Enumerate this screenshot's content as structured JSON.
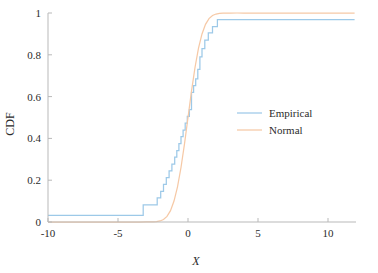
{
  "chart_data": {
    "type": "line",
    "title": "",
    "xlabel": "X",
    "ylabel": "CDF",
    "xlim": [
      -10,
      12
    ],
    "ylim": [
      0,
      1
    ],
    "xticks": [
      -10,
      -5,
      0,
      5,
      10
    ],
    "xticklabels": [
      "-10",
      "-5",
      "0",
      "5",
      "10"
    ],
    "yticks": [
      0,
      0.2,
      0.4,
      0.6,
      0.8,
      1
    ],
    "yticklabels": [
      "0",
      "0.2",
      "0.4",
      "0.6",
      "0.8",
      "1"
    ],
    "grid": false,
    "legend_position": "center-right",
    "series": [
      {
        "name": "Empirical",
        "color": "#9dc9e8",
        "style": "step-post",
        "x": [
          -10,
          -5.4,
          -3.2,
          -2.6,
          -2.2,
          -1.95,
          -1.75,
          -1.55,
          -1.35,
          -1.15,
          -0.95,
          -0.8,
          -0.65,
          -0.5,
          -0.35,
          -0.2,
          -0.05,
          0.1,
          0.25,
          0.4,
          0.55,
          0.7,
          0.85,
          1.0,
          1.2,
          1.45,
          1.75,
          2.1,
          11.9
        ],
        "y": [
          0.032,
          0.032,
          0.082,
          0.082,
          0.115,
          0.147,
          0.18,
          0.212,
          0.245,
          0.277,
          0.31,
          0.342,
          0.375,
          0.408,
          0.44,
          0.473,
          0.505,
          0.538,
          0.62,
          0.652,
          0.685,
          0.73,
          0.79,
          0.83,
          0.87,
          0.905,
          0.935,
          0.968,
          0.968
        ]
      },
      {
        "name": "Normal",
        "color": "#f6c9a6",
        "style": "smooth",
        "mu": 0.0,
        "sigma": 0.78,
        "x": [
          -10,
          -9,
          -8,
          -7,
          -6,
          -5,
          -4.5,
          -4,
          -3.5,
          -3,
          -2.75,
          -2.5,
          -2.25,
          -2,
          -1.75,
          -1.5,
          -1.25,
          -1,
          -0.75,
          -0.5,
          -0.25,
          0,
          0.25,
          0.5,
          0.75,
          1,
          1.25,
          1.5,
          1.75,
          2,
          2.25,
          2.5,
          3,
          3.5,
          4,
          5,
          6,
          7,
          8,
          9,
          10,
          11,
          11.9
        ],
        "y": [
          0.0,
          0.0,
          0.0,
          0.0,
          0.0,
          0.0,
          0.0,
          0.0,
          0.0,
          0.0001,
          0.0002,
          0.0007,
          0.0019,
          0.005,
          0.0119,
          0.0268,
          0.0544,
          0.1003,
          0.1685,
          0.2607,
          0.3735,
          0.5,
          0.6265,
          0.7393,
          0.8315,
          0.8997,
          0.9456,
          0.9732,
          0.9881,
          0.995,
          0.9981,
          0.9993,
          0.9999,
          1.0,
          1.0,
          1.0,
          1.0,
          1.0,
          1.0,
          1.0,
          1.0,
          1.0,
          1.0
        ]
      }
    ]
  },
  "legend": {
    "entries": [
      {
        "label": "Empirical",
        "color": "#9dc9e8"
      },
      {
        "label": "Normal",
        "color": "#f6c9a6"
      }
    ]
  },
  "axes": {
    "x_title": "X",
    "y_title": "CDF"
  },
  "colors": {
    "empirical": "#9dc9e8",
    "normal": "#f6c9a6",
    "axis": "#b9b9b9",
    "text": "#2b2b2b",
    "background": "#ffffff"
  }
}
